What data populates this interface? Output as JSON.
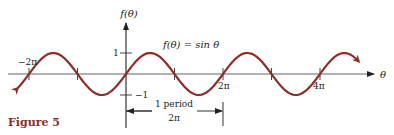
{
  "figure": {
    "caption": "Figure 5",
    "function_label": "f(θ) = sin θ",
    "y_axis_label": "f(θ)",
    "x_axis_label": "θ",
    "period_label": "1 period",
    "period_value": "2π",
    "colors": {
      "curve": "#8b2e2a",
      "axis": "#555555",
      "caption": "#8b2e2a",
      "text": "#222222"
    }
  },
  "chart_data": {
    "type": "line",
    "title": "f(θ) = sin θ",
    "xlabel": "θ",
    "ylabel": "f(θ)",
    "x_ticks": [
      "−2π",
      "2π",
      "4π"
    ],
    "y_ticks": [
      "1",
      "−1"
    ],
    "x_range_radians": [
      -2.23,
      4.8
    ],
    "y_range": [
      -1,
      1
    ],
    "series": [
      {
        "name": "sin θ",
        "function": "sin",
        "amplitude": 1,
        "period": "2π"
      }
    ],
    "annotations": [
      "1 period",
      "2π"
    ],
    "grid": false
  },
  "labels": {
    "x_tick_neg2pi": "−2π",
    "x_tick_2pi": "2π",
    "x_tick_4pi": "4π",
    "y_tick_1": "1",
    "y_tick_neg1": "−1"
  }
}
